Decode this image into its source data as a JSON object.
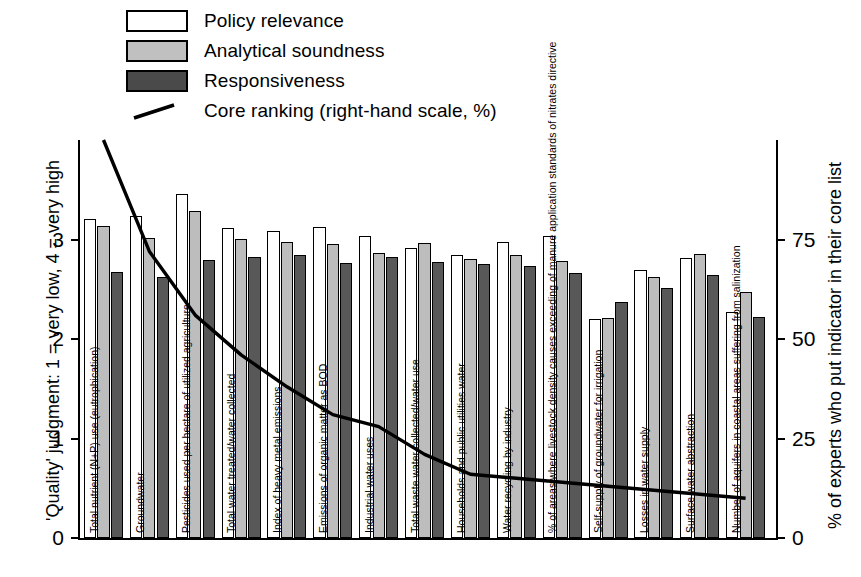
{
  "legend": {
    "items": [
      {
        "label": "Policy relevance",
        "swatch": "white-swatch"
      },
      {
        "label": "Analytical soundness",
        "swatch": "gray-swatch"
      },
      {
        "label": "Responsiveness",
        "swatch": "dark-swatch"
      },
      {
        "label": "Core ranking (right-hand scale, %)",
        "swatch": "line-swatch"
      }
    ]
  },
  "axes": {
    "left_title": "'Quality' judgment:  1 = very low,  4 = very high",
    "right_title": "% of experts who put indicator in their core list",
    "left_ticks": [
      "0",
      "1",
      "2",
      "3"
    ],
    "right_ticks": [
      "0",
      "25",
      "50",
      "75"
    ]
  },
  "colors": {
    "policy_relevance": "#ffffff",
    "analytical_soundness": "#bdbdbd",
    "responsiveness": "#585858",
    "core_ranking_line": "#000000",
    "axis": "#000000"
  },
  "chart_data": {
    "type": "bar",
    "title": "",
    "xlabel": "",
    "ylabel": "'Quality' judgment:  1 = very low,  4 = very high",
    "y2label": "% of experts who put indicator in their core list",
    "ylim": [
      0,
      4
    ],
    "y2lim": [
      0,
      100
    ],
    "yticks": [
      0,
      1,
      2,
      3
    ],
    "y2ticks": [
      0,
      25,
      50,
      75
    ],
    "grid": false,
    "legend_position": "top-left",
    "categories": [
      "Total nutrient (N+P) use (eutrophication)",
      "Groundwater",
      "Pesticides used per hectare of utilized agriculture",
      "Total water treated/water collected",
      "Index of heavy metal emissions",
      "Emissions of organic matter as BOD",
      "Industrial water uses",
      "Total waste water collected/water use",
      "Households and public utilities water",
      "Water recycling by industry",
      "% of areas where livestock density causes exceeding of manure application standards of nitrates directive",
      "Self-supply of groundwater for irrigation",
      "Losses in water supply",
      "Surface water abstraction",
      "Number of aquifers in coastal areas suffering from salinization"
    ],
    "series": [
      {
        "name": "Policy relevance",
        "values": [
          3.21,
          3.24,
          3.46,
          3.12,
          3.09,
          3.13,
          3.04,
          2.91,
          2.84,
          2.98,
          3.04,
          2.2,
          2.69,
          2.81,
          2.27
        ]
      },
      {
        "name": "Analytical soundness",
        "values": [
          3.14,
          3.02,
          3.29,
          3.01,
          2.98,
          2.95,
          2.86,
          2.96,
          2.8,
          2.84,
          2.78,
          2.21,
          2.62,
          2.85,
          2.47
        ]
      },
      {
        "name": "Responsiveness",
        "values": [
          2.67,
          2.62,
          2.79,
          2.82,
          2.84,
          2.76,
          2.82,
          2.77,
          2.75,
          2.73,
          2.66,
          2.37,
          2.51,
          2.64,
          2.22
        ]
      }
    ],
    "line_series": {
      "name": "Core ranking (right-hand scale, %)",
      "axis": "right",
      "values": [
        100,
        72,
        56,
        46,
        38,
        31,
        28,
        21,
        16,
        15,
        14,
        13,
        12,
        11,
        10
      ]
    }
  }
}
